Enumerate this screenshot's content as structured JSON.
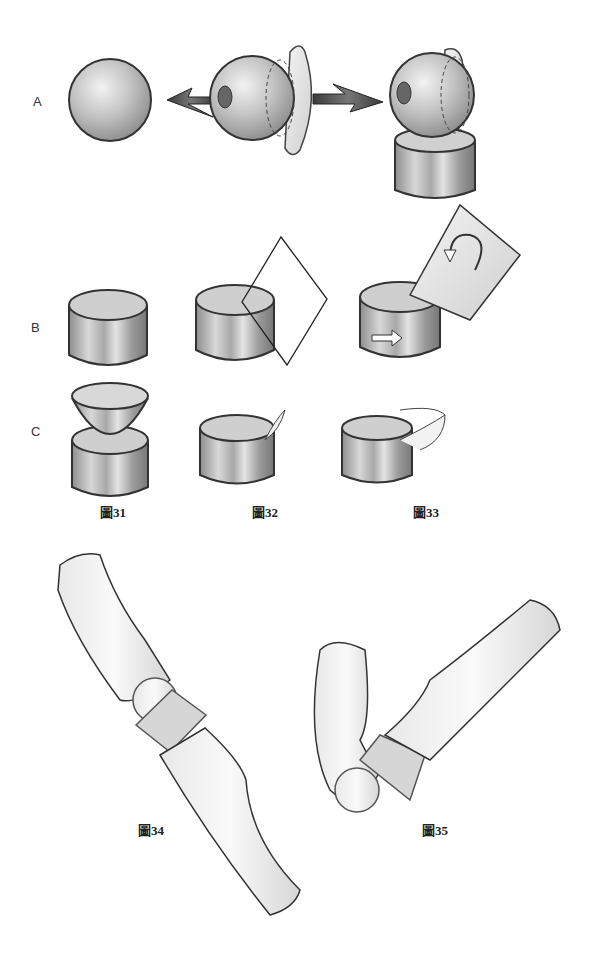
{
  "rows": {
    "a": {
      "label": "A"
    },
    "b": {
      "label": "B"
    },
    "c": {
      "label": "C"
    }
  },
  "figures": [
    {
      "id": "31",
      "label": "圖31"
    },
    {
      "id": "32",
      "label": "圖32"
    },
    {
      "id": "33",
      "label": "圖33"
    },
    {
      "id": "34",
      "label": "圖34"
    },
    {
      "id": "35",
      "label": "圖35"
    }
  ],
  "colors": {
    "outline": "#333333",
    "metal_dark": "#8a8a8a",
    "metal_light": "#e6e6e6",
    "bone": "#f2f2f2",
    "arrow": "#555555"
  }
}
